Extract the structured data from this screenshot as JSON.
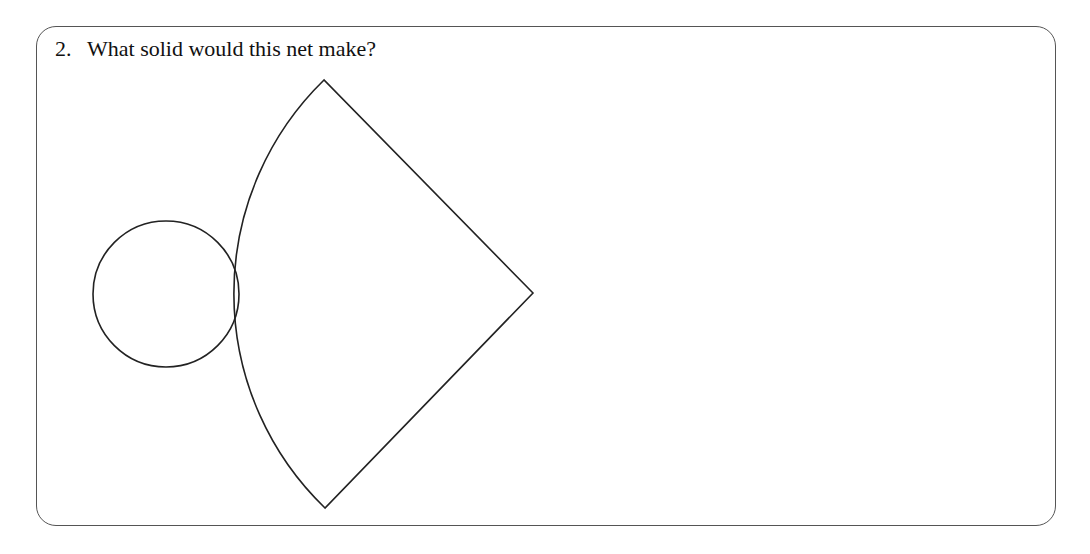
{
  "question": {
    "number": "2.",
    "text": "What solid would this net make?"
  },
  "figure": {
    "stroke_color": "#222222",
    "circle": {
      "cx": 166,
      "cy": 294,
      "r": 73
    },
    "sector": {
      "apex": [
        533,
        293
      ],
      "arc_start": [
        324,
        80
      ],
      "arc_end": [
        325,
        508
      ],
      "radius": 298
    }
  }
}
